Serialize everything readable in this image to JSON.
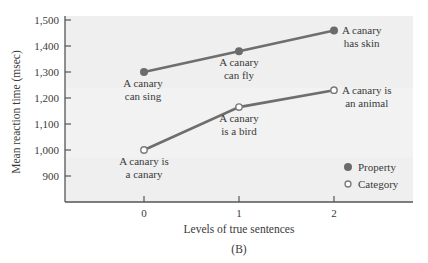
{
  "chart_data": {
    "type": "line",
    "title": "",
    "caption": "(B)",
    "xlabel": "Levels of true sentences",
    "ylabel": "Mean reaction time (msec)",
    "x": [
      0,
      1,
      2
    ],
    "x_tick_labels": [
      "0",
      "1",
      "2"
    ],
    "y_tick_labels": [
      "900",
      "1,000",
      "1,100",
      "1,200",
      "1,300",
      "1,400",
      "1,500"
    ],
    "y_ticks": [
      900,
      1000,
      1100,
      1200,
      1300,
      1400,
      1500
    ],
    "ylim": [
      800,
      1520
    ],
    "xlim": [
      -1,
      2.8
    ],
    "grid": false,
    "legend_position": "lower right inside",
    "series": [
      {
        "name": "Property",
        "marker": "filled-circle",
        "color": "#6b6b6b",
        "values": [
          1300,
          1380,
          1460
        ],
        "annotations": [
          "A canary\ncan sing",
          "A canary\ncan fly",
          "A canary\nhas skin"
        ]
      },
      {
        "name": "Category",
        "marker": "open-circle",
        "color": "#7a7a7a",
        "values": [
          1000,
          1165,
          1230
        ],
        "annotations": [
          "A canary is\na canary",
          "A canary\nis a bird",
          "A canary is\nan animal"
        ]
      }
    ]
  },
  "colors": {
    "plot_background": "#efefef",
    "axis": "#555555",
    "line": "#6e6e6e",
    "text": "#3a3a3a"
  }
}
